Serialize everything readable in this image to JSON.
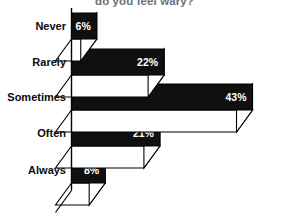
{
  "chart_data": {
    "type": "bar",
    "orientation": "horizontal",
    "style": "3d-horizontal-bar",
    "title": "do you feel wary?",
    "title_note": "Title is clipped at the top edge of the screenshot",
    "xlabel": "",
    "ylabel": "",
    "xlim": [
      0,
      50
    ],
    "grid": false,
    "legend": null,
    "categories": [
      "Never",
      "Rarely",
      "Sometimes",
      "Often",
      "Always"
    ],
    "values": [
      6,
      22,
      43,
      21,
      8
    ],
    "value_labels": [
      "6%",
      "22%",
      "43%",
      "21%",
      "8%"
    ],
    "value_unit": "%",
    "colors": {
      "bar_front": "#101010",
      "bar_side": "#ffffff",
      "outline": "#000000",
      "value_text": "#ffffff",
      "category_text": "#0a0a0a",
      "title_text": "#6f7074",
      "background": "#ffffff"
    }
  },
  "axis": {
    "baseline_name": "category-axis"
  }
}
